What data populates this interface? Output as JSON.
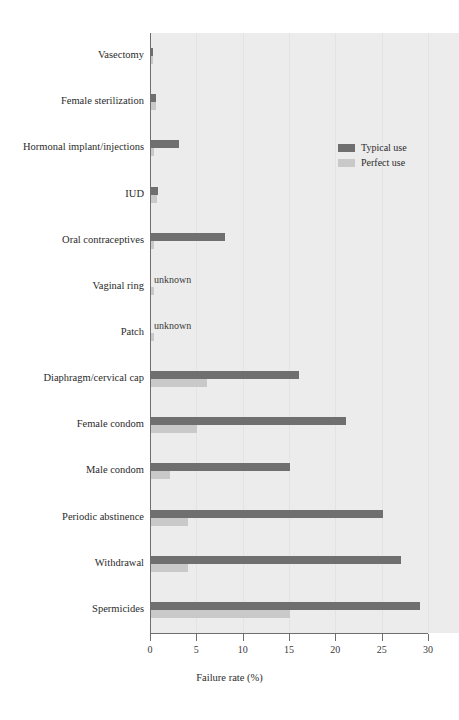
{
  "chart_data": {
    "type": "bar",
    "orientation": "horizontal",
    "title": "",
    "xlabel": "Failure rate (%)",
    "ylabel": "",
    "xlim": [
      0,
      30
    ],
    "xticks": [
      0,
      5,
      10,
      15,
      20,
      25,
      30
    ],
    "xtick_labels": [
      "0",
      "5",
      "10",
      "15",
      "20",
      "25",
      "30"
    ],
    "grid": true,
    "legend_position": "upper right",
    "categories": [
      "Vasectomy",
      "Female sterilization",
      "Hormonal implant/injections",
      "IUD",
      "Oral contraceptives",
      "Vaginal ring",
      "Patch",
      "Diaphragm/cervical cap",
      "Female condom",
      "Male condom",
      "Periodic abstinence",
      "Withdrawal",
      "Spermicides"
    ],
    "series": [
      {
        "name": "Typical use",
        "color": "#6f6f6f",
        "values": [
          0.15,
          0.5,
          3,
          0.8,
          8,
          null,
          null,
          16,
          21,
          15,
          25,
          27,
          29
        ],
        "value_labels": [
          "",
          "",
          "",
          "",
          "",
          "unknown",
          "unknown",
          "",
          "",
          "",
          "",
          "",
          ""
        ]
      },
      {
        "name": "Perfect use",
        "color": "#c9c9c9",
        "values": [
          0.1,
          0.5,
          0.3,
          0.6,
          0.3,
          0.3,
          0.3,
          6,
          5,
          2,
          4,
          4,
          15
        ],
        "value_labels": [
          "",
          "",
          "",
          "",
          "",
          "",
          "",
          "",
          "",
          "",
          "",
          "",
          ""
        ]
      }
    ]
  },
  "legend": {
    "entries": [
      {
        "label": "Typical use",
        "color": "#6f6f6f"
      },
      {
        "label": "Perfect use",
        "color": "#c9c9c9"
      }
    ]
  },
  "axis": {
    "x_title": "Failure rate (%)"
  }
}
